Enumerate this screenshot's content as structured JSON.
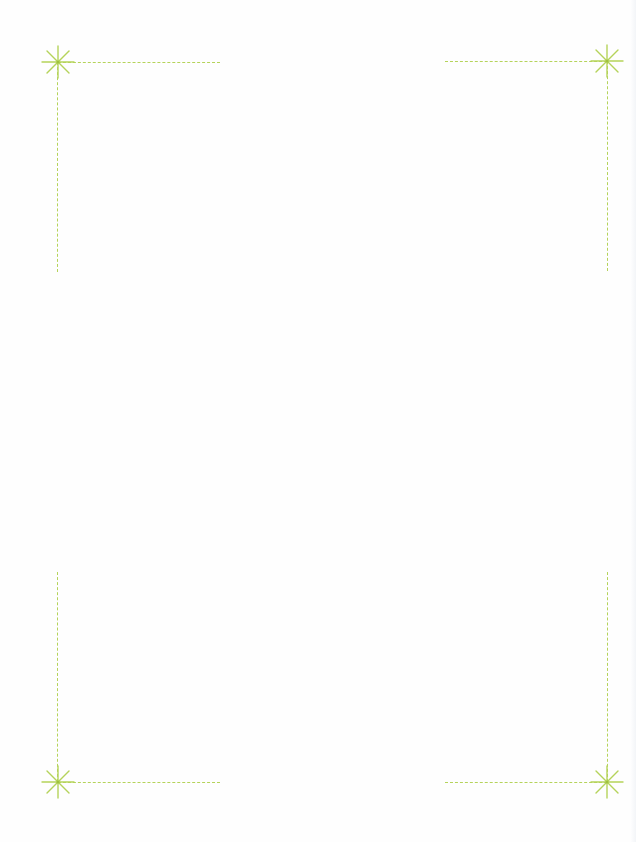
{
  "page": {
    "background": "#fefefe",
    "accent_color": "#b5d35a"
  },
  "corner_marks": [
    {
      "position": "top-left",
      "icon": "asterisk-star-icon"
    },
    {
      "position": "top-right",
      "icon": "asterisk-star-icon"
    },
    {
      "position": "bottom-left",
      "icon": "asterisk-star-icon"
    },
    {
      "position": "bottom-right",
      "icon": "asterisk-star-icon"
    }
  ]
}
